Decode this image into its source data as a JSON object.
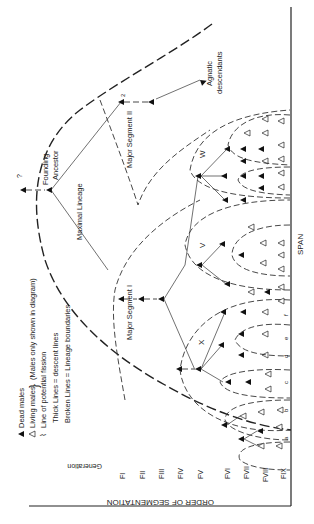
{
  "figure": {
    "orientation": "rotated 90 degrees clockwise",
    "axis_vertical_label": "ORDER OF SEGMENTATION",
    "axis_horizontal_label": "SPAN",
    "generation_header": "Generation",
    "generations": [
      "FI",
      "FII",
      "FIII",
      "FIV",
      "FV",
      "FVI",
      "FVII",
      "FVIII",
      "FIX"
    ]
  },
  "legend": {
    "dead_males": "Dead males",
    "living_males": "Living males",
    "males_note": "(Males only shown in diagram)",
    "fission": "Line of potential fission",
    "thick_lines": "Thick Lines = descent lines",
    "broken_lines": "Broken Lines = Lineage boundaries"
  },
  "labels": {
    "founding_ancestor_1": "Founding",
    "founding_ancestor_2": "Ancestor",
    "question_mark": "?",
    "maximal_lineage": "Maximal Lineage",
    "major_segment_1": "Major Segment I",
    "major_segment_2": "Major Segment II",
    "agnatic_1": "Agnatic",
    "agnatic_2": "descendants",
    "segment_x": "X",
    "segment_v": "V",
    "segment_w": "W"
  },
  "span_letters": [
    "a",
    "b",
    "c",
    "d",
    "e",
    "f"
  ],
  "colors": {
    "ink": "#222222",
    "background": "#ffffff"
  }
}
